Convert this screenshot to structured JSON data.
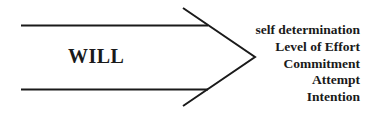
{
  "diagram": {
    "center_label": "WILL",
    "items": [
      {
        "label": "self determination"
      },
      {
        "label": "Level of Effort"
      },
      {
        "label": "Commitment"
      },
      {
        "label": "Attempt"
      },
      {
        "label": "Intention"
      }
    ],
    "colors": {
      "stroke": "#1a1a1a",
      "background": "#ffffff"
    }
  }
}
